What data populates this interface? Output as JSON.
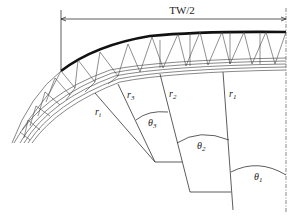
{
  "figure": {
    "dimension_label": "TW/2",
    "radius_labels": [
      {
        "name": "r",
        "sub": "i"
      },
      {
        "name": "r",
        "sub": "3"
      },
      {
        "name": "r",
        "sub": "2"
      },
      {
        "name": "r",
        "sub": "1"
      }
    ],
    "angle_labels": [
      {
        "name": "θ",
        "sub": "3"
      },
      {
        "name": "θ",
        "sub": "2"
      },
      {
        "name": "θ",
        "sub": "1"
      }
    ],
    "colors": {
      "line": "#333333",
      "truss": "#444444",
      "roof_edge": "#111111"
    }
  }
}
